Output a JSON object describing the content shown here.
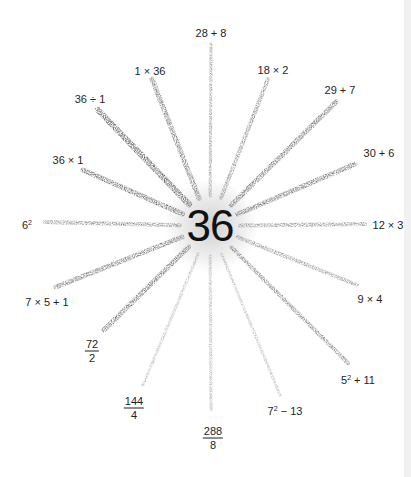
{
  "center": {
    "value": "36",
    "x": 210,
    "y": 226
  },
  "rays": [
    {
      "id": "28-plus-8",
      "label": "28 + 8",
      "lx": 211,
      "ly": 33,
      "x2": 211,
      "y2": 44,
      "width": 3,
      "opacity": 0.55
    },
    {
      "id": "1-times-36",
      "label": "1 × 36",
      "lx": 150,
      "ly": 71,
      "x2": 152,
      "y2": 79,
      "width": 5,
      "opacity": 0.7
    },
    {
      "id": "18-times-2",
      "label": "18 × 2",
      "lx": 273,
      "ly": 70,
      "x2": 268,
      "y2": 79,
      "width": 4,
      "opacity": 0.6
    },
    {
      "id": "36-div-1",
      "label": "36 ÷ 1",
      "lx": 90,
      "ly": 99,
      "x2": 98,
      "y2": 110,
      "width": 6,
      "opacity": 0.9
    },
    {
      "id": "29-plus-7",
      "label": "29 + 7",
      "lx": 340,
      "ly": 90,
      "x2": 336,
      "y2": 102,
      "width": 5,
      "opacity": 0.75
    },
    {
      "id": "36-times-1",
      "label": "36 × 1",
      "lx": 68,
      "ly": 160,
      "x2": 83,
      "y2": 170,
      "width": 5,
      "opacity": 0.8
    },
    {
      "id": "30-plus-6",
      "label": "30 + 6",
      "lx": 379,
      "ly": 153,
      "x2": 355,
      "y2": 164,
      "width": 5,
      "opacity": 0.75
    },
    {
      "id": "6-squared",
      "label": "6",
      "sup": "2",
      "lx": 27,
      "ly": 224,
      "x2": 45,
      "y2": 222,
      "width": 4,
      "opacity": 0.6
    },
    {
      "id": "12-times-3",
      "label": "12 × 3",
      "lx": 388,
      "ly": 225,
      "x2": 365,
      "y2": 224,
      "width": 4,
      "opacity": 0.55
    },
    {
      "id": "7x5plus1",
      "label": "7 × 5 + 1",
      "lx": 47,
      "ly": 302,
      "x2": 56,
      "y2": 287,
      "width": 5,
      "opacity": 0.7
    },
    {
      "id": "9-times-4",
      "label": "9 × 4",
      "lx": 370,
      "ly": 299,
      "x2": 357,
      "y2": 285,
      "width": 4,
      "opacity": 0.55
    },
    {
      "id": "72-over-2",
      "frac": [
        "72",
        "2"
      ],
      "lx": 92,
      "ly": 351,
      "x2": 104,
      "y2": 330,
      "width": 5,
      "opacity": 0.75
    },
    {
      "id": "5sq-plus-11",
      "label": "5",
      "sup": "2",
      "rest": " + 11",
      "lx": 358,
      "ly": 379,
      "x2": 348,
      "y2": 363,
      "width": 4,
      "opacity": 0.65
    },
    {
      "id": "144-over-4",
      "frac": [
        "144",
        "4"
      ],
      "lx": 134,
      "ly": 408,
      "x2": 143,
      "y2": 385,
      "width": 3,
      "opacity": 0.35
    },
    {
      "id": "7sq-minus-13",
      "label": "7",
      "sup": "2",
      "rest": " − 13",
      "lx": 285,
      "ly": 410,
      "x2": 280,
      "y2": 395,
      "width": 3,
      "opacity": 0.35
    },
    {
      "id": "288-over-8",
      "frac": [
        "288",
        "8"
      ],
      "lx": 213,
      "ly": 438,
      "x2": 211,
      "y2": 410,
      "width": 3,
      "opacity": 0.4
    }
  ],
  "colors": {
    "ray": "#2a2a2a",
    "text": "#1e1e1e",
    "background": "#ffffff"
  }
}
